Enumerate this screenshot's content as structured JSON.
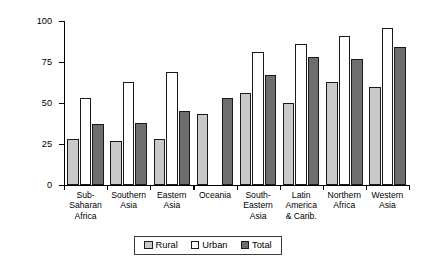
{
  "chart_data": {
    "type": "bar",
    "title": "",
    "xlabel": "",
    "ylabel": "Proportion of Population with Access\nto Improved Sanitation, 2004",
    "ylim": [
      0,
      100
    ],
    "yticks": [
      0,
      25,
      50,
      75,
      100
    ],
    "ytick_labels": [
      "0",
      "25",
      "50",
      "75",
      "100"
    ],
    "grid": false,
    "legend_position": "bottom-center",
    "categories": [
      "Sub-\nSaharan\nAfrica",
      "Southern\nAsia",
      "Eastern\nAsia",
      "Oceania",
      "South-\nEastern\nAsia",
      "Latin\nAmerica\n& Carib.",
      "Northern\nAfrica",
      "Western\nAsia"
    ],
    "series": [
      {
        "name": "Rural",
        "color": "#c9c9c9",
        "values": [
          28,
          27,
          28,
          43,
          56,
          50,
          63,
          60
        ]
      },
      {
        "name": "Urban",
        "color": "#ffffff",
        "values": [
          53,
          63,
          69,
          null,
          81,
          86,
          91,
          96
        ]
      },
      {
        "name": "Total",
        "color": "#6e6e6e",
        "values": [
          37,
          38,
          45,
          53,
          67,
          78,
          77,
          84
        ]
      }
    ]
  },
  "legend": {
    "items": [
      {
        "label": "Rural"
      },
      {
        "label": "Urban"
      },
      {
        "label": "Total"
      }
    ]
  }
}
